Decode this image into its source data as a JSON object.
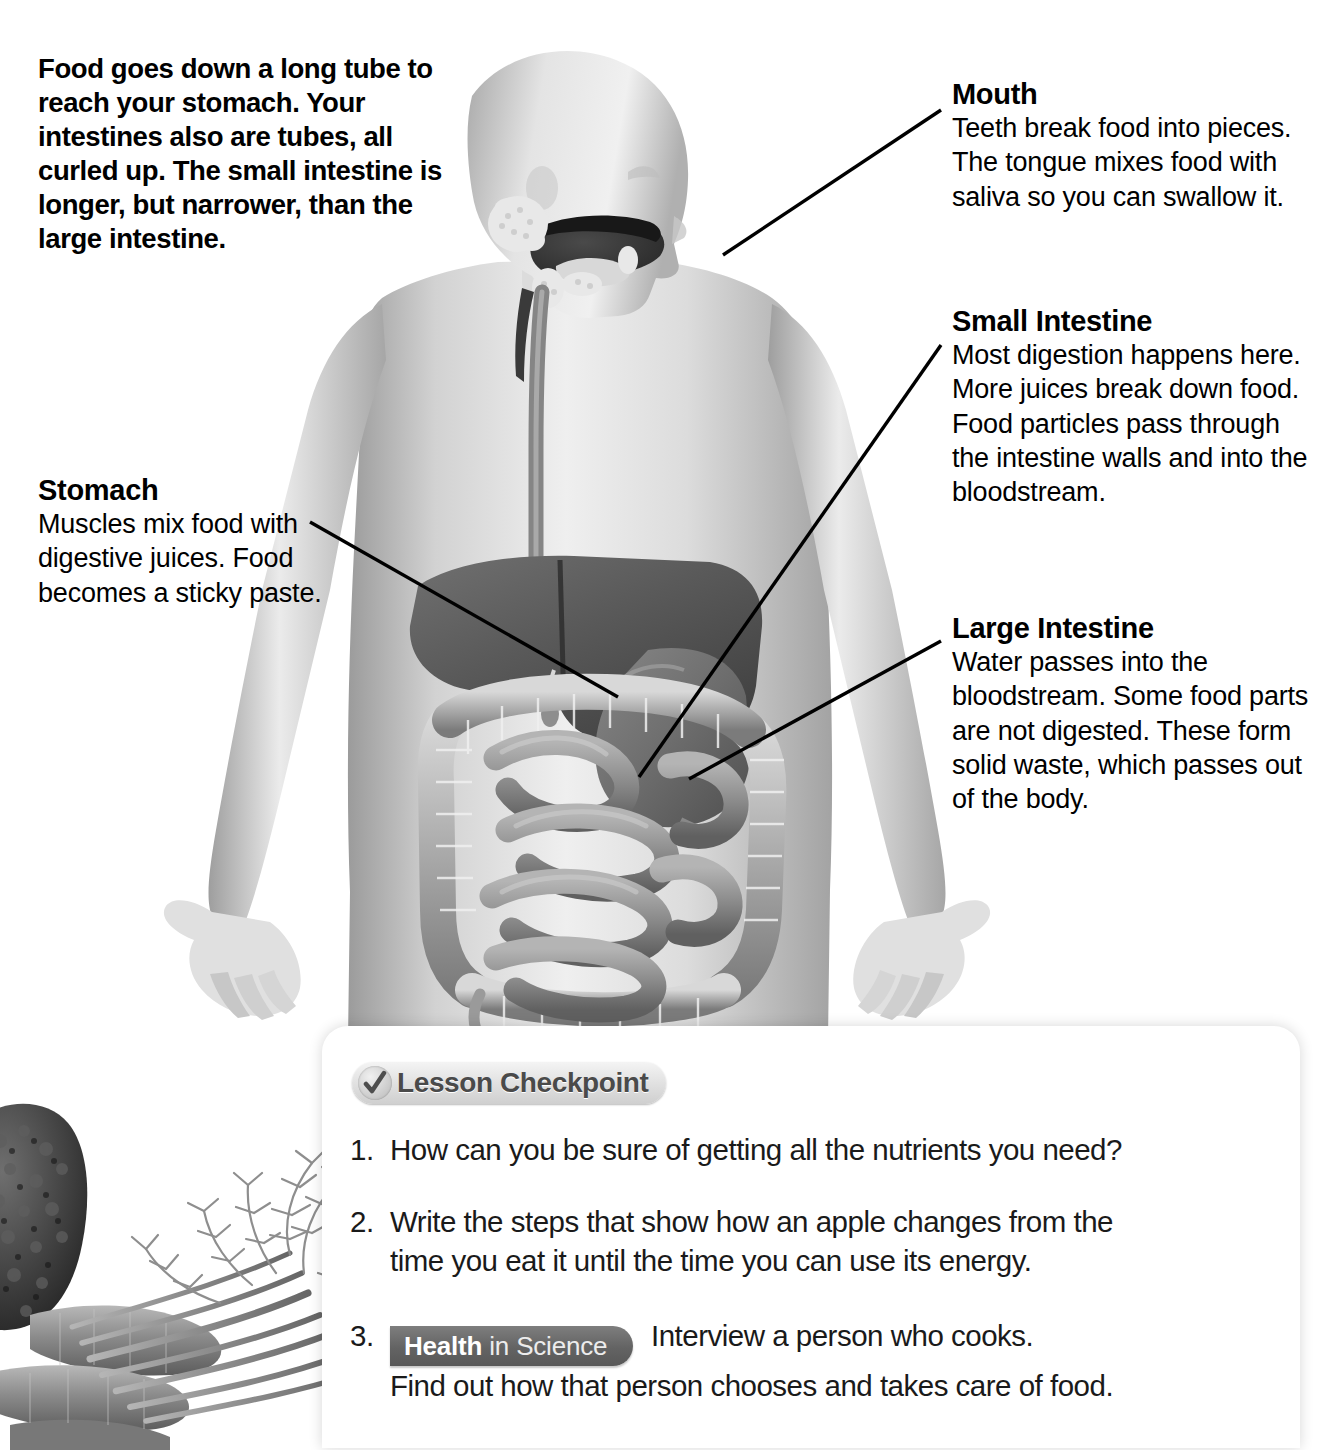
{
  "page": {
    "background": "#ffffff",
    "intro_text": "Food goes down a long tube to reach your stomach. Your intestines also are tubes, all curled up. The small intestine is longer, but narrower, than the large intestine."
  },
  "callouts": [
    {
      "id": "mouth",
      "title": "Mouth",
      "body": "Teeth break food into pieces. The tongue mixes food with saliva so you can swallow it."
    },
    {
      "id": "small_intestine",
      "title": "Small Intestine",
      "body": "Most digestion happens here. More juices break down food. Food particles pass through the intestine walls and into the bloodstream."
    },
    {
      "id": "large_intestine",
      "title": "Large Intestine",
      "body": "Water passes into the bloodstream. Some food parts are not digested. These form solid waste, which passes out of the body."
    },
    {
      "id": "stomach",
      "title": "Stomach",
      "body": "Muscles mix food with digestive juices. Food becomes a sticky paste."
    }
  ],
  "figure": {
    "organs": [
      "esophagus",
      "liver",
      "stomach",
      "small-intestine",
      "large-intestine",
      "salivary-glands",
      "tongue"
    ]
  },
  "photo": {
    "description": "black and white photo of broccoli and carrots with leafy tops"
  },
  "checkpoint": {
    "title": "Lesson Checkpoint",
    "check_icon": "checkmark-icon",
    "questions": [
      {
        "number": "1.",
        "text": "How can you be sure of getting all the nutrients you need?"
      },
      {
        "number": "2.",
        "line1": "Write the steps that show how an apple changes from the",
        "line2": "time you eat it until the time you can use its energy."
      },
      {
        "number": "3.",
        "badge_bold": "Health",
        "badge_rest": "in Science",
        "line1": "Interview a person who cooks.",
        "line2": "Find out how that person chooses and takes care of food."
      }
    ]
  },
  "colors": {
    "text": "#000000",
    "badge_dark": "#636363",
    "badge_light": "#e2e2e2",
    "badge_title_text": "#4a4a4a"
  }
}
